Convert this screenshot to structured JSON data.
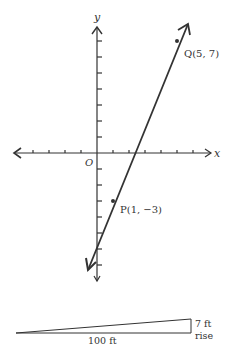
{
  "graph": {
    "origin_label": "O",
    "x_axis_label": "x",
    "y_axis_label": "y",
    "unit_px": 16,
    "origin_px": [
      97,
      153
    ],
    "x_ticks": [
      -4,
      -3,
      -2,
      -1,
      1,
      2,
      3,
      4,
      5,
      6
    ],
    "y_ticks": [
      -7,
      -6,
      -5,
      -4,
      -3,
      -2,
      -1,
      1,
      2,
      3,
      4,
      5,
      6,
      7
    ],
    "points": [
      {
        "name": "Q",
        "x": 5,
        "y": 7,
        "label": "Q(5, 7)"
      },
      {
        "name": "P",
        "x": 1,
        "y": -3,
        "label": "P(1, −3)"
      }
    ],
    "line_color": "#333333"
  },
  "slope_figure": {
    "run_label": "100 ft",
    "rise_value_label": "7 ft",
    "rise_word_label": "rise"
  }
}
